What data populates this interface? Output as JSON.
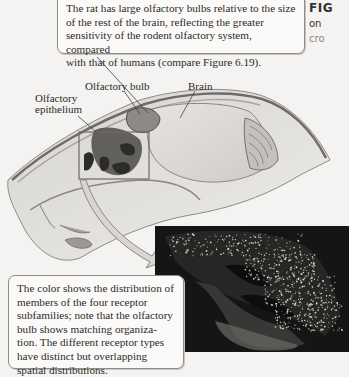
{
  "figure": {
    "title_fragment": "FIG",
    "caption_line2_fragment": "on",
    "caption_line3_fragment": "cro"
  },
  "callouts": {
    "top": {
      "lines": [
        "The rat has large olfactory bulbs relative to the size",
        "of the rest of the brain, reflecting the greater",
        "sensitivity of the rodent olfactory system, compared",
        "with that of humans (compare Figure 6.19)."
      ]
    },
    "bottom": {
      "lines": [
        "The color shows the distribution of",
        "members of the four receptor",
        "subfamilies; note that the olfactory",
        "bulb shows matching organiza-",
        "tion. The different receptor types",
        "have distinct but overlapping",
        "spatial distributions."
      ]
    }
  },
  "labels": {
    "olfactory_bulb": "Olfactory bulb",
    "brain": "Brain",
    "olfactory_epithelium_line1": "Olfactory",
    "olfactory_epithelium_line2": "epithelium"
  },
  "colors": {
    "callout_border": "#8f8c88",
    "callout_bg": "#fbfaf8",
    "micrograph_bg": "#141414",
    "dots": "#e8e6d8",
    "arrow_fill": "#d9d6d0"
  }
}
